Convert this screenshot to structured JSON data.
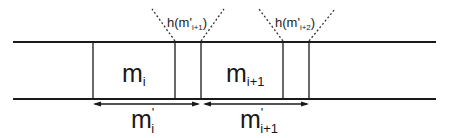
{
  "diagram": {
    "blocks": [
      {
        "label": "m",
        "subscript": "i"
      },
      {
        "label": "m",
        "subscript": "i+1"
      }
    ],
    "overlaps": [
      {
        "label_prefix": "h(m",
        "prime": "'",
        "subscript": "i+1",
        "label_suffix": ")"
      },
      {
        "label_prefix": "h(m",
        "prime": "'",
        "subscript": "i+2",
        "label_suffix": ")"
      }
    ],
    "spans": [
      {
        "label": "m",
        "prime": "'",
        "subscript": "i"
      },
      {
        "label": "m",
        "prime": "'",
        "subscript": "i+1"
      }
    ],
    "colors": {
      "line": "#1a1a1a",
      "background": "#ffffff"
    }
  }
}
